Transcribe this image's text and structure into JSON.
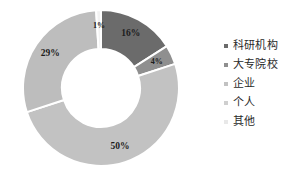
{
  "chart_data": {
    "type": "pie",
    "variant": "donut",
    "title": "",
    "subtitle": "",
    "xlabel": "",
    "ylabel": "",
    "grid": false,
    "legend_position": "right",
    "hole_ratio": 0.5,
    "start_angle_deg": 0,
    "direction": "clockwise",
    "categories": [
      "科研机构",
      "大专院校",
      "企业",
      "个人",
      "其他"
    ],
    "values": [
      16,
      4,
      50,
      29,
      1
    ],
    "value_labels": [
      "16%",
      "4%",
      "50%",
      "29%",
      "1%"
    ],
    "colors": [
      "#6b6b6b",
      "#8f8f8f",
      "#c2c2c2",
      "#bdbdbd",
      "#f2f2f2"
    ],
    "separator_color": "#ffffff",
    "label_color": "#1c1c1c"
  },
  "legend": {
    "items": [
      {
        "label": "科研机构",
        "color": "#6b6b6b",
        "marker": "square-marker"
      },
      {
        "label": "大专院校",
        "color": "#8f8f8f",
        "marker": "square-marker"
      },
      {
        "label": "企业",
        "color": "#c2c2c2",
        "marker": "square-marker"
      },
      {
        "label": "个人",
        "color": "#cfcfcf",
        "marker": "square-marker"
      },
      {
        "label": "其他",
        "color": "#e8e8e8",
        "marker": "square-marker"
      }
    ]
  },
  "slices": [
    {
      "label": "16%",
      "name": "slice-科研机构"
    },
    {
      "label": "4%",
      "name": "slice-大专院校"
    },
    {
      "label": "50%",
      "name": "slice-企业"
    },
    {
      "label": "29%",
      "name": "slice-个人"
    },
    {
      "label": "1%",
      "name": "slice-其他"
    }
  ]
}
